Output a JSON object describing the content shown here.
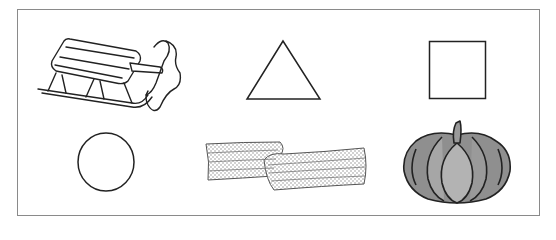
{
  "worksheet": {
    "items": [
      {
        "name": "sled",
        "kind": "picture"
      },
      {
        "name": "triangle",
        "kind": "shape"
      },
      {
        "name": "square",
        "kind": "shape"
      },
      {
        "name": "circle",
        "kind": "shape"
      },
      {
        "name": "scarf",
        "kind": "picture"
      },
      {
        "name": "pumpkin",
        "kind": "picture"
      }
    ],
    "colors": {
      "frame": "#8a8a8a",
      "stroke": "#222222",
      "pumpkin_fill": "#8f8f8f",
      "background": "#ffffff"
    }
  }
}
